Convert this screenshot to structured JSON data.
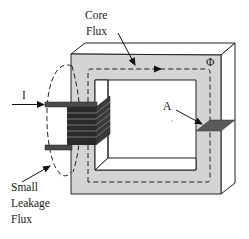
{
  "diagram": {
    "type": "magnetic-core-with-coil",
    "labels": {
      "core_flux_line1": "Core",
      "core_flux_line2": "Flux",
      "current": "I",
      "flux_symbol": "Φ",
      "area": "A",
      "leakage_line1": "Small",
      "leakage_line2": "Leakage",
      "leakage_line3": "Flux"
    },
    "colors": {
      "core_face": "#d4d4d4",
      "core_side": "#ffffff",
      "outline": "#222222",
      "coil": "#4a4a4a",
      "coil_stripe": "#1e1e1e",
      "cross_section": "#5a5a5a",
      "background": "#ffffff"
    },
    "coil_turns": 6
  }
}
